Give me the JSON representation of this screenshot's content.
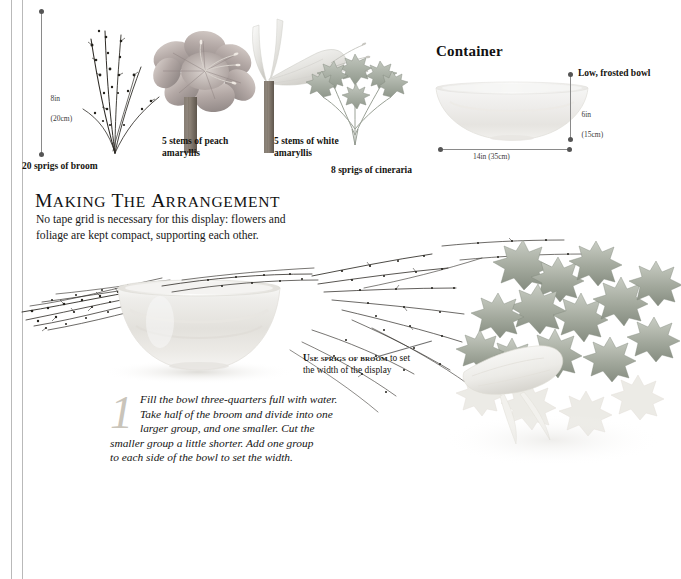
{
  "page": {
    "background": "#ffffff",
    "rule_color": "#b9b9b9"
  },
  "specimens": {
    "height_dim": {
      "value_in": "8in",
      "value_cm": "(20cm)"
    },
    "items": [
      {
        "id": "broom",
        "caption": "20 sprigs of broom"
      },
      {
        "id": "peach-amaryllis",
        "caption_line1": "5 stems of peach",
        "caption_line2": "amaryllis"
      },
      {
        "id": "white-amaryllis",
        "caption_line1": "5 stems of white",
        "caption_line2": "amaryllis"
      },
      {
        "id": "cineraria",
        "caption": "8 sprigs of cineraria"
      }
    ]
  },
  "container": {
    "heading": "Container",
    "note": "Low, frosted bowl",
    "height_in": "6in",
    "height_cm": "(15cm)",
    "width_label": "14in (35cm)"
  },
  "arrangement": {
    "title_word1_cap": "M",
    "title_word1_rest": "AKING",
    "title_word2_cap": "T",
    "title_word2_rest": "HE",
    "title_word3_cap": "A",
    "title_word3_rest": "RRANGEMENT",
    "title_plain": "MAKING THE ARRANGEMENT",
    "intro_line1": "No tape grid is necessary for this display: flowers and",
    "intro_line2": "foliage are kept compact, supporting each other."
  },
  "step": {
    "number": "1",
    "line1": "Fill the bowl three-quarters full with water.",
    "line2": "Take half of the broom and divide into one",
    "line3": "larger group, and one smaller. Cut the",
    "line4": "smaller group a little shorter. Add one group",
    "line5": "to each side of the bowl to set the width."
  },
  "callout": {
    "emphasis": "Use sprigs of broom",
    "rest": " to set",
    "line2": "the width of the display"
  },
  "colors": {
    "ink": "#15140f",
    "dim_line": "#8a8a8a",
    "dim_dot": "#555555",
    "drop_cap": "#c9c4ba",
    "foliage_grey_green": "#9aa196",
    "twig_dark": "#3d3a33",
    "bowl_frost": "#eceae6"
  }
}
